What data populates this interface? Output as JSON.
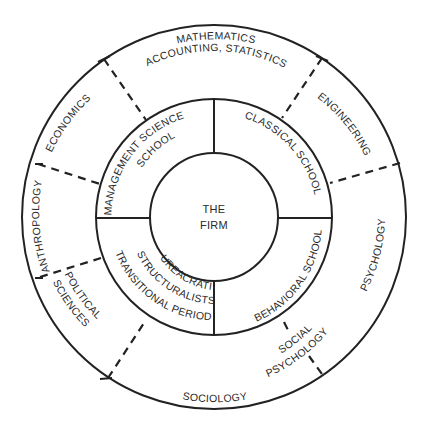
{
  "diagram": {
    "center": {
      "label_line1": "THE",
      "label_line2": "FIRM"
    },
    "inner_ring": {
      "segments": [
        {
          "id": "management-science",
          "line1": "MANAGEMENT SCIENCE",
          "line2": "SCHOOL"
        },
        {
          "id": "classical",
          "line1": "CLASSICAL SCHOOL"
        },
        {
          "id": "behavioral",
          "line1": "BEHAVIORAL SCHOOL"
        },
        {
          "id": "bureacratic",
          "line1": "BUREACRATIC",
          "line2": "STRUCTURALISTS",
          "line3": "TRANSITIONAL PERIOD"
        }
      ]
    },
    "outer_ring": {
      "segments": [
        {
          "id": "mathematics",
          "line1": "MATHEMATICS",
          "line2": "ACCOUNTING, STATISTICS"
        },
        {
          "id": "engineering",
          "line1": "ENGINEERING"
        },
        {
          "id": "psychology",
          "line1": "PSYCHOLOGY"
        },
        {
          "id": "social-psychology",
          "line1": "SOCIAL",
          "line2": "PSYCHOLOGY"
        },
        {
          "id": "sociology",
          "line1": "SOCIOLOGY"
        },
        {
          "id": "political-sciences",
          "line1": "POLITICAL",
          "line2": "SCIENCES"
        },
        {
          "id": "anthropology",
          "line1": "ANTHROPOLOGY"
        },
        {
          "id": "economics",
          "line1": "ECONOMICS"
        }
      ]
    },
    "colors": {
      "line": "#222222",
      "text": "#2a2a2a",
      "background": "#ffffff"
    }
  }
}
